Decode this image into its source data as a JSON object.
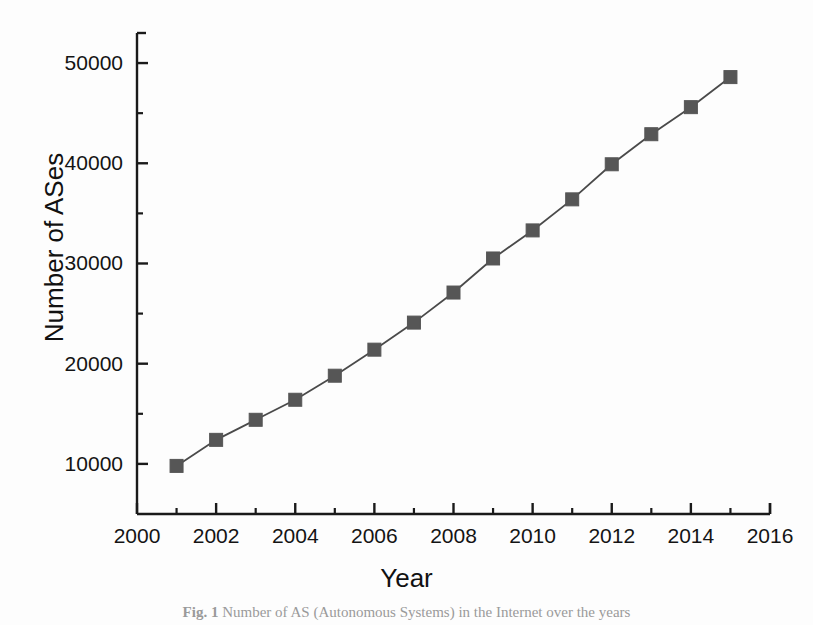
{
  "figure": {
    "caption_label": "Fig. 1",
    "caption_text": "Number of AS (Autonomous Systems) in the Internet over the years",
    "background_color": "#fdfdfd",
    "marker_color": "#565656",
    "line_color": "#4a4a4a",
    "axis_color": "#1a1a1a"
  },
  "chart_data": {
    "type": "line",
    "title": "",
    "xlabel": "Year",
    "ylabel": "Number of ASes",
    "xlim": [
      2000,
      2016
    ],
    "ylim": [
      5000,
      53000
    ],
    "grid": false,
    "legend": null,
    "marker": "square",
    "x": [
      2001,
      2002,
      2003,
      2004,
      2005,
      2006,
      2007,
      2008,
      2009,
      2010,
      2011,
      2012,
      2013,
      2014,
      2015
    ],
    "values": [
      9800,
      12400,
      14400,
      16400,
      18800,
      21400,
      24100,
      27100,
      30500,
      33300,
      36400,
      39900,
      42900,
      45600,
      48600
    ],
    "series": [
      {
        "name": "Number of ASes",
        "values": [
          9800,
          12400,
          14400,
          16400,
          18800,
          21400,
          24100,
          27100,
          30500,
          33300,
          36400,
          39900,
          42900,
          45600,
          48600
        ]
      }
    ],
    "x_ticks": [
      2000,
      2002,
      2004,
      2006,
      2008,
      2010,
      2012,
      2014,
      2016
    ],
    "x_tick_labels": [
      "2000",
      "2002",
      "2004",
      "2006",
      "2008",
      "2010",
      "2012",
      "2014",
      "2016"
    ],
    "x_minor_ticks": [
      2001,
      2003,
      2005,
      2007,
      2009,
      2011,
      2013,
      2015
    ],
    "y_ticks": [
      10000,
      20000,
      30000,
      40000,
      50000
    ],
    "y_tick_labels": [
      "10000",
      "20000",
      "30000",
      "40000",
      "50000"
    ],
    "y_minor_ticks": [
      15000,
      25000,
      35000,
      45000
    ]
  }
}
